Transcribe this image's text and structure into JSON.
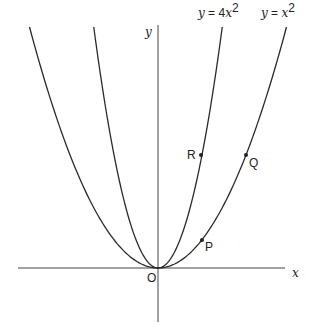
{
  "diagram": {
    "type": "function-graph",
    "axes": {
      "x_label": "x",
      "y_label": "y",
      "origin_label": "O"
    },
    "curves": [
      {
        "name": "steep-parabola",
        "equation_label": "y = 4x²",
        "lhs": "y",
        "eq": " = 4",
        "var": "x",
        "power": "2",
        "coefficient": 4
      },
      {
        "name": "standard-parabola",
        "equation_label": "y = x²",
        "lhs": "y",
        "eq": " = ",
        "var": "x",
        "power": "2",
        "coefficient": 1
      }
    ],
    "points": [
      {
        "label": "P",
        "on_curve": "y = x²"
      },
      {
        "label": "Q",
        "on_curve": "y = x²"
      },
      {
        "label": "R",
        "on_curve": "y = 4x²"
      }
    ]
  }
}
